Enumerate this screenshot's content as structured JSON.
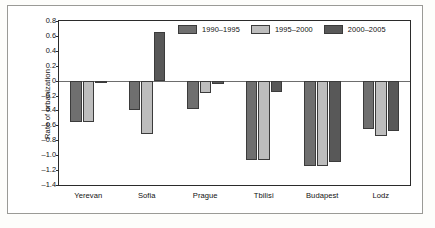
{
  "chart_data": {
    "type": "bar",
    "title": "",
    "xlabel": "",
    "ylabel": "Rate of urbanization",
    "categories": [
      "Yerevan",
      "Sofia",
      "Prague",
      "Tbilisi",
      "Budapest",
      "Lodz"
    ],
    "series": [
      {
        "name": "1990–1995",
        "color": "#6f6f6f",
        "values": [
          -0.56,
          -0.39,
          -0.38,
          -1.07,
          -1.15,
          -0.65
        ]
      },
      {
        "name": "1995–2000",
        "color": "#bdbdbd",
        "values": [
          -0.56,
          -0.71,
          -0.16,
          -1.07,
          -1.15,
          -0.74
        ]
      },
      {
        "name": "2000–2005",
        "color": "#585858",
        "values": [
          -0.02,
          0.65,
          -0.05,
          -0.15,
          -1.09,
          -0.67
        ]
      }
    ],
    "ylim": [
      -1.4,
      0.8
    ],
    "yticks": [
      "0.8",
      "0.6",
      "0.4",
      "0.2",
      "0",
      "–0.2",
      "–0.4",
      "–0.6",
      "–0.8",
      "–1.0",
      "–1.2",
      "–1.4"
    ],
    "ytick_values": [
      0.8,
      0.6,
      0.4,
      0.2,
      0,
      -0.2,
      -0.4,
      -0.6,
      -0.8,
      -1.0,
      -1.2,
      -1.4
    ],
    "grid": false,
    "legend_position": "top-right",
    "zero_line": true
  },
  "legend": {
    "items": [
      {
        "label": "1990–1995",
        "color": "#6f6f6f"
      },
      {
        "label": "1995–2000",
        "color": "#bdbdbd"
      },
      {
        "label": "2000–2005",
        "color": "#585858"
      }
    ]
  },
  "colors": {
    "axis": "#2b2b2b",
    "zero_line": "#6d6d6d",
    "outer_frame": "#9a9a96",
    "background": "#ffffff",
    "text": "#111111"
  }
}
